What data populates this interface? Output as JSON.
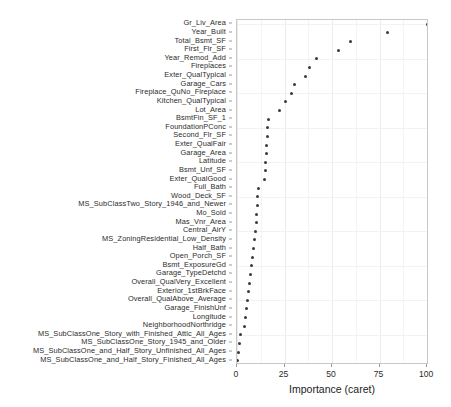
{
  "chart_data": {
    "type": "scatter",
    "title": "",
    "xlabel": "Importance (caret)",
    "ylabel": "",
    "xlim": [
      0,
      101
    ],
    "xticks": [
      0,
      25,
      50,
      75,
      100
    ],
    "xticklabels": [
      "0",
      "25",
      "50",
      "75",
      "100"
    ],
    "grid": true,
    "legend": "none",
    "orientation": "horizontal",
    "categories": [
      "Gr_Liv_Area",
      "Year_Built",
      "Total_Bsmt_SF",
      "First_Flr_SF",
      "Year_Remod_Add",
      "Fireplaces",
      "Exter_QualTypical",
      "Garage_Cars",
      "Fireplace_QuNo_Fireplace",
      "Kitchen_QualTypical",
      "Lot_Area",
      "BsmtFin_SF_1",
      "FoundationPConc",
      "Second_Flr_SF",
      "Exter_QualFair",
      "Garage_Area",
      "Latitude",
      "Bsmt_Unf_SF",
      "Exter_QualGood",
      "Full_Bath",
      "Wood_Deck_SF",
      "MS_SubClassTwo_Story_1946_and_Newer",
      "Mo_Sold",
      "Mas_Vnr_Area",
      "Central_AirY",
      "MS_ZoningResidential_Low_Density",
      "Half_Bath",
      "Open_Porch_SF",
      "Bsmt_ExposureGd",
      "Garage_TypeDetchd",
      "Overall_QualVery_Excellent",
      "Exterior_1stBrkFace",
      "Overall_QualAbove_Average",
      "Garage_FinishUnf",
      "Longitude",
      "NeighborhoodNorthridge",
      "MS_SubClassOne_Story_with_Finished_Attic_All_Ages",
      "MS_SubClassOne_Story_1945_and_Older",
      "MS_SubClassOne_and_Half_Story_Unfinished_All_Ages",
      "MS_SubClassOne_and_Half_Story_Finished_All_Ages"
    ],
    "values": [
      100.0,
      79.0,
      59.5,
      53.5,
      42.0,
      38.0,
      36.0,
      30.5,
      28.5,
      25.5,
      22.5,
      16.5,
      16.0,
      16.0,
      15.5,
      15.5,
      15.0,
      15.0,
      14.5,
      11.5,
      11.0,
      11.0,
      10.5,
      10.0,
      9.5,
      9.0,
      8.5,
      8.0,
      7.5,
      7.0,
      6.5,
      6.0,
      5.5,
      5.0,
      4.5,
      4.0,
      2.0,
      1.5,
      1.0,
      0.5
    ]
  },
  "axis": {
    "x_title": "Importance (caret)"
  }
}
